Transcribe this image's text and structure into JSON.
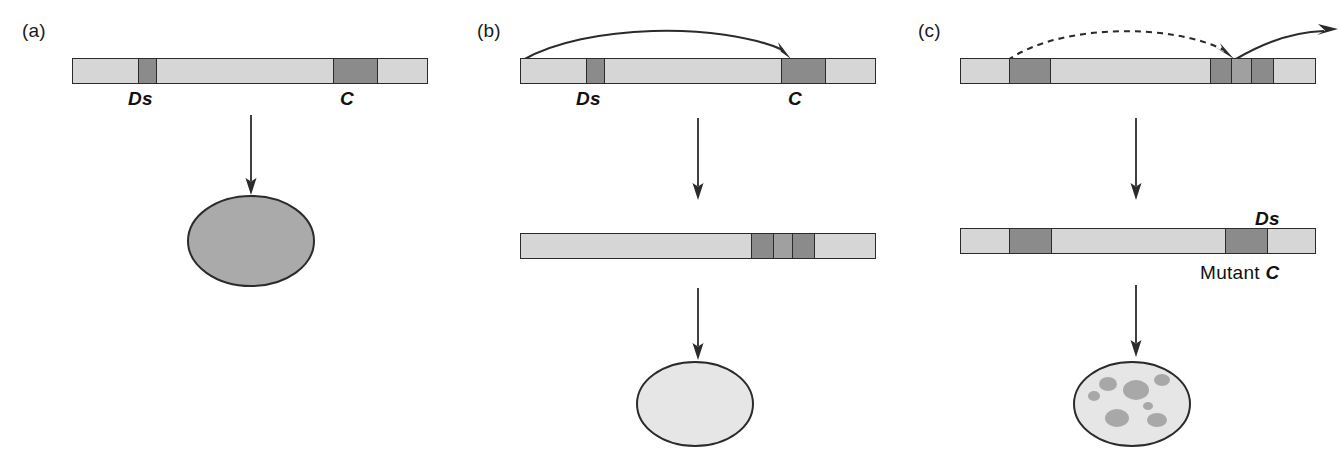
{
  "figure": {
    "type": "diagram",
    "colors": {
      "light_gray": "#d6d6d6",
      "dark_gray": "#8b8b8b",
      "mid_gray": "#a0a0a0",
      "outline": "#2b2b2b",
      "spot_gray": "#a8a8a8",
      "background": "#ffffff"
    }
  },
  "panels": [
    {
      "id": "a",
      "label": "(a)",
      "chromosomes": [
        {
          "name": "chromosome-a-top",
          "segments": [
            {
              "tone": "light",
              "width": 65
            },
            {
              "tone": "dark",
              "width": 18,
              "label": "Ds"
            },
            {
              "tone": "light",
              "width": 178
            },
            {
              "tone": "dark",
              "width": 45,
              "label": "C"
            },
            {
              "tone": "light",
              "width": 50
            }
          ],
          "labels": [
            {
              "text": "Ds",
              "style": "italic-bold",
              "position": "below"
            },
            {
              "text": "C",
              "style": "italic-bold",
              "position": "below"
            }
          ]
        }
      ],
      "arrows": [
        {
          "kind": "vertical-solid",
          "meaning": "leads-to"
        }
      ],
      "kernel": {
        "name": "kernel-pigmented",
        "fill": "#aaaaaa",
        "spots": [],
        "description": "fully pigmented kernel"
      }
    },
    {
      "id": "b",
      "label": "(b)",
      "chromosomes": [
        {
          "name": "chromosome-b-top",
          "segments": [
            {
              "tone": "light",
              "width": 65
            },
            {
              "tone": "dark",
              "width": 18,
              "label": "Ds"
            },
            {
              "tone": "light",
              "width": 178
            },
            {
              "tone": "dark",
              "width": 45,
              "label": "C"
            },
            {
              "tone": "light",
              "width": 50
            }
          ],
          "labels": [
            {
              "text": "Ds",
              "style": "italic-bold",
              "position": "below"
            },
            {
              "text": "C",
              "style": "italic-bold",
              "position": "below"
            }
          ]
        },
        {
          "name": "chromosome-b-bottom",
          "segments": [
            {
              "tone": "light",
              "width": 231
            },
            {
              "tone": "dark",
              "width": 22
            },
            {
              "tone": "mid",
              "width": 20,
              "label": "Ds"
            },
            {
              "tone": "dark",
              "width": 22
            },
            {
              "tone": "light",
              "width": 61
            }
          ],
          "labels": [
            {
              "text": "Ds",
              "style": "italic-bold",
              "position": "above"
            },
            {
              "text": "Mutant C",
              "style": "upright-plus-italic",
              "position": "below",
              "upright_part": "Mutant ",
              "italic_part": "C"
            }
          ]
        }
      ],
      "arrows": [
        {
          "kind": "curved-solid",
          "meaning": "Ds transposes into C"
        },
        {
          "kind": "vertical-solid",
          "meaning": "leads-to"
        },
        {
          "kind": "vertical-solid",
          "meaning": "leads-to"
        }
      ],
      "kernel": {
        "name": "kernel-colorless",
        "fill": "#e6e6e6",
        "spots": [],
        "description": "colorless kernel"
      }
    },
    {
      "id": "c",
      "label": "(c)",
      "chromosomes": [
        {
          "name": "chromosome-c-top",
          "segments": [
            {
              "tone": "light",
              "width": 48
            },
            {
              "tone": "dark",
              "width": 42,
              "label": "Ac"
            },
            {
              "tone": "light",
              "width": 160
            },
            {
              "tone": "dark",
              "width": 22
            },
            {
              "tone": "mid",
              "width": 20,
              "label": "Ds"
            },
            {
              "tone": "dark",
              "width": 22
            },
            {
              "tone": "light",
              "width": 42
            }
          ],
          "labels": [
            {
              "text": "Ac",
              "style": "italic-bold",
              "position": "below"
            },
            {
              "text": "Ds",
              "style": "italic-bold",
              "position": "below"
            }
          ]
        },
        {
          "name": "chromosome-c-bottom",
          "segments": [
            {
              "tone": "light",
              "width": 48
            },
            {
              "tone": "dark",
              "width": 42,
              "label": "Ac"
            },
            {
              "tone": "light",
              "width": 175
            },
            {
              "tone": "dark",
              "width": 42,
              "label": "C"
            },
            {
              "tone": "light",
              "width": 48
            }
          ],
          "labels": [
            {
              "text": "Ac",
              "style": "italic-bold",
              "position": "below"
            },
            {
              "text": "C",
              "style": "italic-bold",
              "position": "below"
            }
          ]
        }
      ],
      "arrows": [
        {
          "kind": "curved-dashed",
          "meaning": "Ac activates Ds"
        },
        {
          "kind": "curved-solid-exit",
          "meaning": "Ds excises"
        },
        {
          "kind": "vertical-solid",
          "meaning": "leads-to"
        },
        {
          "kind": "vertical-solid",
          "meaning": "leads-to"
        }
      ],
      "kernel": {
        "name": "kernel-spotted",
        "fill": "#e6e6e6",
        "spots": [
          {
            "cx": 38,
            "cy": 26,
            "rx": 9,
            "ry": 7
          },
          {
            "cx": 66,
            "cy": 32,
            "rx": 13,
            "ry": 10
          },
          {
            "cx": 92,
            "cy": 22,
            "rx": 8,
            "ry": 6
          },
          {
            "cx": 24,
            "cy": 38,
            "rx": 6,
            "ry": 5
          },
          {
            "cx": 78,
            "cy": 48,
            "rx": 5,
            "ry": 4
          },
          {
            "cx": 47,
            "cy": 60,
            "rx": 12,
            "ry": 9
          },
          {
            "cx": 87,
            "cy": 62,
            "rx": 10,
            "ry": 7
          }
        ],
        "description": "spotted / variegated kernel"
      }
    }
  ]
}
